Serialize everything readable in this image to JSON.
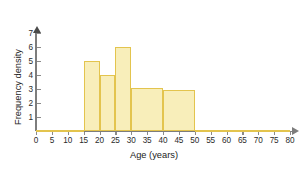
{
  "chart_data": {
    "type": "bar",
    "title": "",
    "xlabel": "Age (years)",
    "ylabel": "Frequency density",
    "xlim": [
      0,
      80
    ],
    "ylim": [
      0,
      7.3
    ],
    "grid": false,
    "legend": null,
    "x_ticks": [
      0,
      5,
      10,
      15,
      20,
      25,
      30,
      35,
      40,
      45,
      50,
      55,
      60,
      65,
      70,
      75,
      80
    ],
    "x_tick_labels": [
      "0",
      "5",
      "10",
      "15",
      "20",
      "25",
      "30",
      "35",
      "40",
      "45",
      "50",
      "55",
      "60",
      "65",
      "70",
      "75",
      "80"
    ],
    "y_ticks": [
      1,
      2,
      3,
      4,
      5,
      6,
      7
    ],
    "y_tick_labels": [
      "1",
      "2",
      "3",
      "4",
      "5",
      "6",
      "7"
    ],
    "bin_edges": [
      0,
      15,
      20,
      25,
      30,
      40,
      50,
      80
    ],
    "bins": [
      {
        "label": "0-15",
        "x0": 0,
        "x1": 15,
        "frequency_density": 0.1
      },
      {
        "label": "15-20",
        "x0": 15,
        "x1": 20,
        "frequency_density": 5.0
      },
      {
        "label": "20-25",
        "x0": 20,
        "x1": 25,
        "frequency_density": 4.0
      },
      {
        "label": "25-30",
        "x0": 25,
        "x1": 30,
        "frequency_density": 6.0
      },
      {
        "label": "30-40",
        "x0": 30,
        "x1": 40,
        "frequency_density": 3.1
      },
      {
        "label": "40-50",
        "x0": 40,
        "x1": 50,
        "frequency_density": 2.95
      },
      {
        "label": "50-80",
        "x0": 50,
        "x1": 80,
        "frequency_density": 0.1
      }
    ],
    "values": [
      0.1,
      5.0,
      4.0,
      6.0,
      3.1,
      2.95,
      0.1
    ],
    "categories": [
      "0-15",
      "15-20",
      "20-25",
      "25-30",
      "30-40",
      "40-50",
      "50-80"
    ],
    "colors": {
      "bar_fill": "#f8eeba",
      "bar_border": "#e3c44e",
      "axis": "#7d7d7d",
      "text": "#222222",
      "background": "#ffffff"
    }
  }
}
